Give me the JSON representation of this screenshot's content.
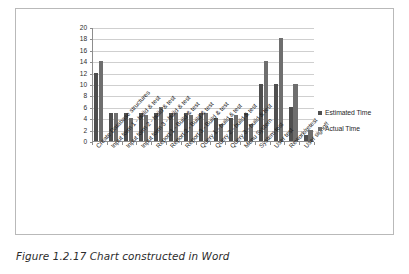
{
  "caption": "Figure 1.2.17  Chart constructed in Word",
  "legend": {
    "position": "right",
    "items": [
      {
        "label": "Estimated Time",
        "color": "#4f4f4f",
        "marker": "square-marker-icon"
      },
      {
        "label": "Actual Time",
        "color": "#6e6e6e",
        "marker": "square-marker-icon"
      }
    ]
  },
  "chart_data": {
    "type": "bar",
    "title": "",
    "xlabel": "",
    "ylabel": "",
    "ylim": [
      0,
      20
    ],
    "ytick_step": 2,
    "yticks": [
      "20",
      "18",
      "16",
      "14",
      "12",
      "10",
      "8",
      "6",
      "4",
      "2",
      "0"
    ],
    "grid": true,
    "legend_position": "right",
    "categories": [
      "Create Database structures",
      "Input form 1 - build & test",
      "Input form 2 - build & test",
      "Input form 3 - build & test",
      "Report 1 - Build & test",
      "Report 2 - Build & test",
      "Report 3 - Build & test",
      "Query 1 - build & test",
      "Query 2 - build & test",
      "Query 3 - build & test",
      "Menu System",
      "System test",
      "User test",
      "Rework/retest",
      "User signoff"
    ],
    "series": [
      {
        "name": "Estimated Time",
        "color": "#4f4f4f",
        "values": [
          12,
          5,
          5,
          5,
          5,
          5,
          5,
          5,
          4,
          4,
          5,
          10,
          10,
          6,
          1
        ]
      },
      {
        "name": "Actual Time",
        "color": "#6e6e6e",
        "values": [
          14,
          5,
          4,
          4.5,
          6,
          5,
          4.5,
          5,
          3,
          4.5,
          3,
          14,
          18,
          10,
          2
        ]
      }
    ]
  }
}
